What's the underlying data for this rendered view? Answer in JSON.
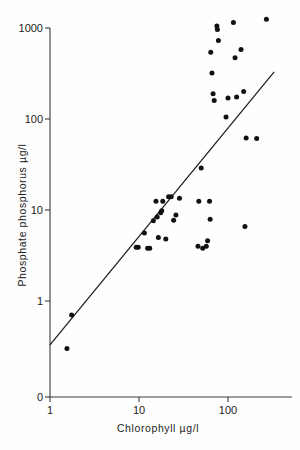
{
  "figure": {
    "background": "#fefefe",
    "ink_color": "#111111",
    "top_cropped_text": "",
    "caption": ""
  },
  "chart_data": {
    "type": "scatter",
    "title": "",
    "xlabel": "Chlorophyll  µg/l",
    "ylabel": "Phosphate  phosphorus  µg/l",
    "xscale": "log",
    "yscale": "log",
    "xlim": [
      1,
      400
    ],
    "ylim": [
      0.25,
      1500
    ],
    "grid": false,
    "legend": null,
    "x_tick_labels": [
      "1",
      "10",
      "100"
    ],
    "x_tick_values": [
      1,
      10,
      100
    ],
    "y_tick_labels": [
      "0",
      "1",
      "10",
      "100",
      "1000"
    ],
    "y_tick_values": [
      0,
      1,
      10,
      100,
      1000
    ],
    "origin_label": "0",
    "points": [
      {
        "x": 1.55,
        "y": 0.3
      },
      {
        "x": 1.75,
        "y": 0.7
      },
      {
        "x": 9.3,
        "y": 3.9
      },
      {
        "x": 9.8,
        "y": 3.9
      },
      {
        "x": 11.5,
        "y": 5.6
      },
      {
        "x": 12.5,
        "y": 3.8
      },
      {
        "x": 13.2,
        "y": 3.8
      },
      {
        "x": 14.5,
        "y": 7.6
      },
      {
        "x": 15.5,
        "y": 12.5
      },
      {
        "x": 16.0,
        "y": 8.4
      },
      {
        "x": 16.5,
        "y": 5.0
      },
      {
        "x": 17.5,
        "y": 9.3
      },
      {
        "x": 18.0,
        "y": 9.8
      },
      {
        "x": 18.5,
        "y": 12.5
      },
      {
        "x": 20.0,
        "y": 4.8
      },
      {
        "x": 21.5,
        "y": 14.0
      },
      {
        "x": 23.0,
        "y": 14.0
      },
      {
        "x": 24.5,
        "y": 7.7
      },
      {
        "x": 26.0,
        "y": 8.8
      },
      {
        "x": 28.5,
        "y": 13.5
      },
      {
        "x": 46.0,
        "y": 4.0
      },
      {
        "x": 47.0,
        "y": 12.5
      },
      {
        "x": 50.0,
        "y": 29.0
      },
      {
        "x": 52.0,
        "y": 3.8
      },
      {
        "x": 57.0,
        "y": 4.0
      },
      {
        "x": 59.0,
        "y": 4.6
      },
      {
        "x": 62.0,
        "y": 12.5
      },
      {
        "x": 63.0,
        "y": 7.9
      },
      {
        "x": 64.0,
        "y": 540.0
      },
      {
        "x": 66.0,
        "y": 320.0
      },
      {
        "x": 68.0,
        "y": 190.0
      },
      {
        "x": 70.0,
        "y": 160.0
      },
      {
        "x": 75.0,
        "y": 1050.0
      },
      {
        "x": 76.0,
        "y": 960.0
      },
      {
        "x": 78.0,
        "y": 730.0
      },
      {
        "x": 95.0,
        "y": 105.0
      },
      {
        "x": 100.0,
        "y": 170.0
      },
      {
        "x": 115.0,
        "y": 1150.0
      },
      {
        "x": 120.0,
        "y": 470.0
      },
      {
        "x": 125.0,
        "y": 175.0
      },
      {
        "x": 140.0,
        "y": 580.0
      },
      {
        "x": 150.0,
        "y": 200.0
      },
      {
        "x": 155.0,
        "y": 6.6
      },
      {
        "x": 160.0,
        "y": 62.0
      },
      {
        "x": 210.0,
        "y": 61.0
      },
      {
        "x": 270.0,
        "y": 1250.0
      }
    ],
    "fit_line": {
      "type": "regression",
      "x_start": 1.0,
      "y_start": 0.33,
      "x_end": 330.0,
      "y_end": 330.0
    }
  }
}
